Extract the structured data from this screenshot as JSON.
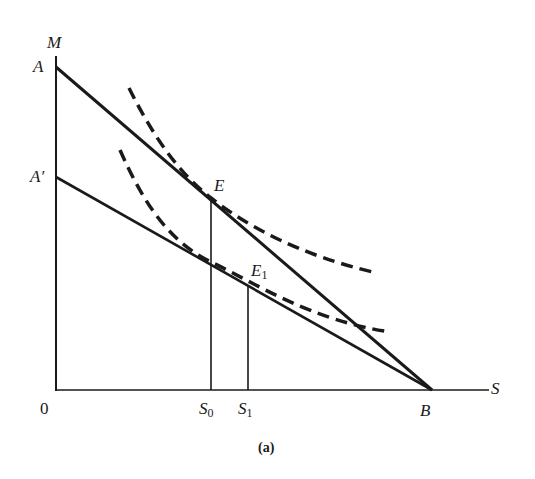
{
  "figure": {
    "caption": "(a)",
    "axes": {
      "y_label": "M",
      "x_label": "S",
      "origin_label": "0"
    },
    "points": {
      "A": "A",
      "A_prime": "A′",
      "B": "B",
      "E": "E",
      "E1_main": "E",
      "E1_sub": "1",
      "S0_main": "S",
      "S0_sub": "0",
      "S1_main": "S",
      "S1_sub": "1"
    },
    "colors": {
      "ink": "#1a1a1a",
      "background": "#ffffff"
    },
    "elements": [
      {
        "type": "budget-line",
        "from": "A",
        "to": "B",
        "style": "solid"
      },
      {
        "type": "budget-line",
        "from": "A′",
        "to": "B",
        "style": "solid"
      },
      {
        "type": "indifference-curve",
        "tangent_at": "E",
        "style": "dashed"
      },
      {
        "type": "indifference-curve",
        "tangent_at": "E1",
        "style": "dashed"
      },
      {
        "type": "drop-line",
        "from": "E",
        "to": "S0"
      },
      {
        "type": "drop-line",
        "from": "E1",
        "to": "S1"
      }
    ]
  }
}
